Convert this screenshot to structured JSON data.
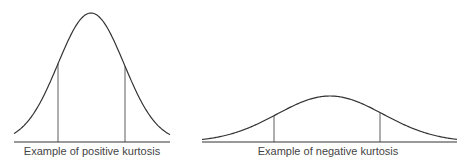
{
  "chart_data": [
    {
      "type": "line",
      "title": "Example of positive kurtosis",
      "description": "Tall, narrow bell curve with two vertical markers at +/- one standard deviation",
      "peak": {
        "x": 91,
        "y": 13
      },
      "baseline": {
        "y": 142,
        "x_start": 14,
        "x_end": 170
      },
      "markers_x": [
        58,
        125
      ],
      "marker_top_y": 102,
      "sigma_px": 33
    },
    {
      "type": "line",
      "title": "Example of negative kurtosis",
      "description": "Short, wide bell curve with two vertical markers at +/- one standard deviation",
      "peak": {
        "x": 330,
        "y": 96
      },
      "baseline": {
        "y": 142,
        "x_start": 202,
        "x_end": 457
      },
      "markers_x": [
        274,
        380
      ],
      "marker_top_y": 127,
      "sigma_px": 53
    }
  ],
  "labels": {
    "positive": "Example of positive kurtosis",
    "negative": "Example of negative kurtosis"
  },
  "colors": {
    "stroke": "#333333",
    "text": "#444444"
  }
}
